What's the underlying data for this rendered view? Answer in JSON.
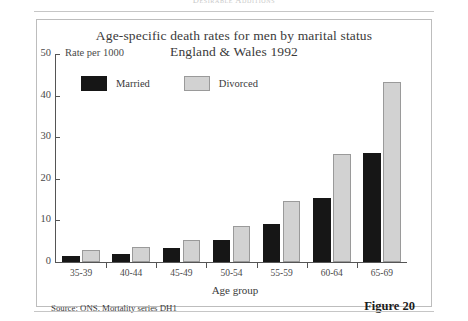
{
  "page": {
    "running_header": "Desirable Additions"
  },
  "figure": {
    "title_line1": "Age-specific death rates for men by marital status",
    "title_line2": "England & Wales 1992",
    "source_note": "Source: ONS, Mortality series DH1",
    "figure_label": "Figure 20"
  },
  "colors": {
    "married": "#161616",
    "divorced": "#d2d2d2",
    "divorced_border": "#9a9a9a",
    "axis": "#555555",
    "frame": "#bdbdbd"
  },
  "chart_data": {
    "type": "bar",
    "title": "Age-specific death rates for men by marital status England & Wales 1992",
    "xlabel": "Age group",
    "ylabel": "Rate per 1000",
    "categories": [
      "35-39",
      "40-44",
      "45-49",
      "50-54",
      "55-59",
      "60-64",
      "65-69"
    ],
    "series": [
      {
        "name": "Married",
        "values": [
          1.5,
          2.0,
          3.2,
          5.3,
          9.0,
          15.0,
          25.8
        ]
      },
      {
        "name": "Divorced",
        "values": [
          2.8,
          3.5,
          5.3,
          8.5,
          14.3,
          25.5,
          42.5
        ]
      }
    ],
    "ylim": [
      0,
      50
    ],
    "yticks": [
      0,
      10,
      20,
      30,
      40,
      50
    ],
    "ytick_labels": [
      "0",
      "10",
      "20",
      "30",
      "40",
      "50"
    ],
    "grid": false,
    "legend_position": "top-left-inside",
    "legend": [
      "Married",
      "Divorced"
    ]
  }
}
